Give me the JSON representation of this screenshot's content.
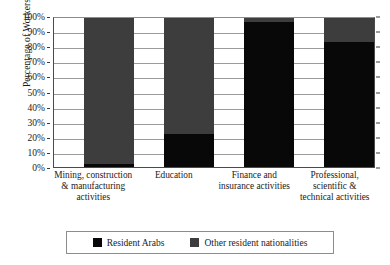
{
  "chart_data": {
    "type": "bar",
    "subtype": "stacked-100-percent",
    "title": "",
    "xlabel": "",
    "ylabel": "Percentage of Workers",
    "ylim": [
      0,
      100
    ],
    "ytick_labels": [
      "100%",
      "90%",
      "80%",
      "70%",
      "60%",
      "50%",
      "40%",
      "30%",
      "20%",
      "10%",
      "0%"
    ],
    "ytick_values": [
      100,
      90,
      80,
      70,
      60,
      50,
      40,
      30,
      20,
      10,
      0
    ],
    "grid": true,
    "legend_position": "bottom",
    "categories": [
      "Mining, construction & manufacturing activities",
      "Education",
      "Finance and insurance activities",
      "Professional, scientific & technical activities"
    ],
    "series": [
      {
        "name": "Resident Arabs",
        "color": "#080808",
        "values": [
          3,
          23,
          97,
          84
        ]
      },
      {
        "name": "Other resident nationalities",
        "color": "#3d3d3d",
        "values": [
          97,
          77,
          3,
          16
        ]
      }
    ]
  },
  "axis": {
    "y_title": "Percentage of Workers"
  },
  "legend": {
    "items": [
      {
        "label": "Resident Arabs",
        "swatch": "black-swatch-icon"
      },
      {
        "label": "Other resident nationalities",
        "swatch": "gray-swatch-icon"
      }
    ]
  }
}
